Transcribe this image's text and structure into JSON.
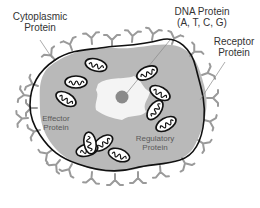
{
  "diagram": {
    "type": "cell-protein-diagram",
    "labels": {
      "cytoplasmic": {
        "line1": "Cytoplasmic",
        "line2": "Protein"
      },
      "dna": {
        "line1": "DNA Protein",
        "line2": "(A, T, C, G)"
      },
      "receptor": {
        "line1": "Receptor",
        "line2": "Protein"
      },
      "effector": {
        "line1": "Effector",
        "line2": "Protein"
      },
      "regulatory": {
        "line1": "Regulatory",
        "line2": "Protein"
      }
    },
    "colors": {
      "cytoplasm": "#b9b9b9",
      "membrane": "#111111",
      "receptors": "#9a9a9a",
      "nucleus_region": "#f4f4f4",
      "nucleolus": "#8a8a8a",
      "organelle_fill": "#ffffff",
      "label_text": "#333333"
    },
    "organelle_count": 11
  }
}
